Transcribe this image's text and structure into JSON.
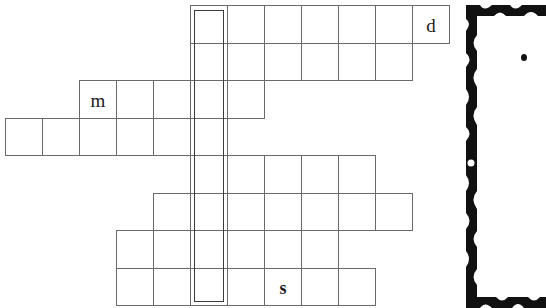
{
  "puzzle": {
    "type": "crossword",
    "grid": {
      "origin_x": 5,
      "origin_y": 5,
      "cell_width": 37,
      "cell_height": 37.5,
      "rows": [
        {
          "row": 0,
          "start_col": 5,
          "end_col": 11
        },
        {
          "row": 1,
          "start_col": 5,
          "end_col": 10
        },
        {
          "row": 2,
          "start_col": 2,
          "end_col": 6
        },
        {
          "row": 3,
          "start_col": 0,
          "end_col": 5
        },
        {
          "row": 4,
          "start_col": 5,
          "end_col": 9
        },
        {
          "row": 5,
          "start_col": 4,
          "end_col": 10
        },
        {
          "row": 6,
          "start_col": 3,
          "end_col": 8
        },
        {
          "row": 7,
          "start_col": 3,
          "end_col": 9
        }
      ]
    },
    "highlighted_column": {
      "col": 5,
      "start_row": 0,
      "end_row": 7
    },
    "letters": [
      {
        "row": 0,
        "col": 11,
        "char": "d",
        "bold": false
      },
      {
        "row": 2,
        "col": 2,
        "char": "m",
        "bold": false
      },
      {
        "row": 7,
        "col": 7,
        "char": "s",
        "bold": true
      }
    ]
  },
  "side_panel": {
    "frame_color": "#111111",
    "bullet": "•"
  },
  "colors": {
    "grid_line": "#6a6a6a",
    "highlight_border": "#3c3c3c",
    "background": "#ffffff",
    "text": "#1a1a1a"
  }
}
